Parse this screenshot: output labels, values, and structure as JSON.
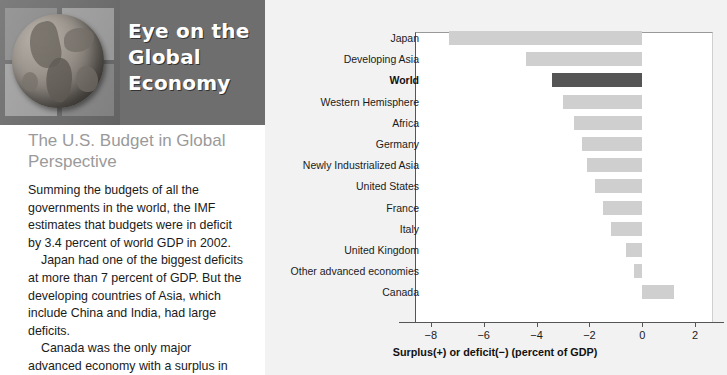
{
  "masthead": {
    "lines": [
      "Eye on the",
      "Global",
      "Economy"
    ],
    "band_color": "#6e6e6e",
    "text_color": "#ffffff",
    "globe_icon": "globe-icon"
  },
  "article": {
    "title": "The U.S. Budget in Global Perspective",
    "title_color": "#9a9a9a",
    "paragraphs": [
      "Summing the budgets of all the governments in the world, the IMF estimates that budgets were in deficit by 3.4 percent of world GDP in 2002.",
      "Japan had one of the biggest deficits at more than 7 percent of GDP. But the developing countries of Asia, which include China and India, had large deficits.",
      "Canada was the only major advanced economy with a surplus in"
    ]
  },
  "chart_data": {
    "type": "bar",
    "orientation": "horizontal",
    "title": "",
    "xlabel": "Surplus(+) or deficit(−) (percent of GDP)",
    "ylabel": "",
    "xlim": [
      -8.6,
      2.6
    ],
    "xticks": [
      -8,
      -6,
      -4,
      -2,
      0,
      2
    ],
    "xtick_labels": [
      "−8",
      "−6",
      "−4",
      "−2",
      "0",
      "2"
    ],
    "grid": false,
    "legend": false,
    "highlight_category": "World",
    "bar_color": "#cfcfcf",
    "highlight_color": "#555555",
    "categories": [
      "Japan",
      "Developing Asia",
      "World",
      "Western Hemisphere",
      "Africa",
      "Germany",
      "Newly Industrialized Asia",
      "United States",
      "France",
      "Italy",
      "United Kingdom",
      "Other advanced economies",
      "Canada"
    ],
    "values": [
      -7.3,
      -4.4,
      -3.4,
      -3.0,
      -2.6,
      -2.3,
      -2.1,
      -1.8,
      -1.5,
      -1.2,
      -0.6,
      -0.3,
      1.2
    ]
  }
}
